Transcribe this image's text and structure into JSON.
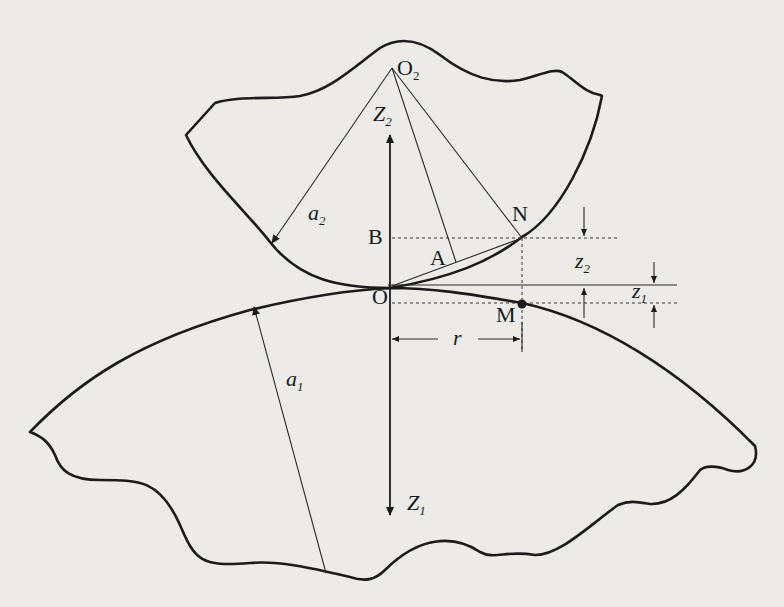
{
  "diagram": {
    "labels": {
      "O2": {
        "base": "O",
        "sub": "2"
      },
      "Z2": {
        "base": "Z",
        "sub": "2"
      },
      "a2": {
        "base": "a",
        "sub": "2"
      },
      "B": "B",
      "N": "N",
      "A": "A",
      "O": "O",
      "M": "M",
      "r": "r",
      "z2": {
        "base": "z",
        "sub": "2"
      },
      "z1": {
        "base": "z",
        "sub": "1"
      },
      "a1": {
        "base": "a",
        "sub": "1"
      },
      "Z1": {
        "base": "Z",
        "sub": "1"
      }
    },
    "colors": {
      "background": "#ecebe8",
      "ink": "#1b1b1b"
    }
  }
}
